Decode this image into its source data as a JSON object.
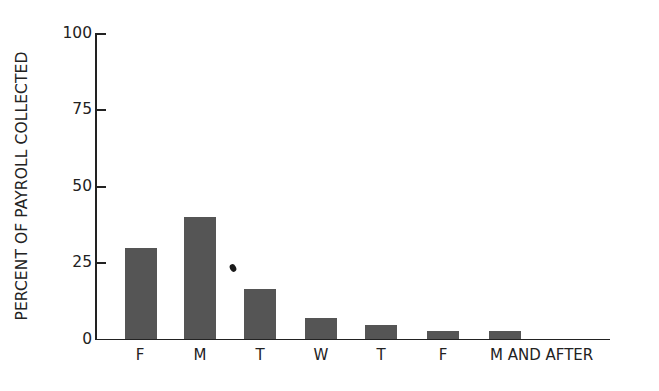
{
  "chart_data": {
    "type": "bar",
    "title": "",
    "xlabel": "",
    "ylabel": "PERCENT OF PAYROLL COLLECTED",
    "ylim": [
      0,
      100
    ],
    "yticks": [
      0,
      25,
      50,
      75,
      100
    ],
    "grid": false,
    "legend": null,
    "categories": [
      "F",
      "M",
      "T",
      "W",
      "T",
      "F",
      "M AND AFTER"
    ],
    "values": [
      30,
      40,
      16.5,
      7,
      4.5,
      2.5,
      2.5
    ],
    "bar_color": "#555555"
  },
  "axis": {
    "y_label": "PERCENT OF PAYROLL COLLECTED",
    "y_ticks": [
      "100",
      "75",
      "50",
      "25",
      "0"
    ],
    "x_ticks": [
      "F",
      "M",
      "T",
      "W",
      "T",
      "F",
      "M AND AFTER"
    ]
  }
}
